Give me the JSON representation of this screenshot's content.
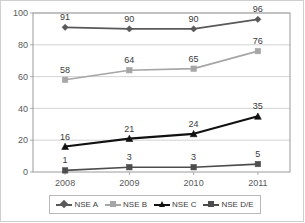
{
  "chart_data": {
    "type": "line",
    "title": "",
    "subtitle": "",
    "xlabel": "",
    "ylabel": "",
    "categories": [
      "2008",
      "2009",
      "2010",
      "2011"
    ],
    "ylim": [
      0,
      100
    ],
    "yticks": [
      0,
      20,
      40,
      60,
      80,
      100
    ],
    "grid": true,
    "grid_axis": "y",
    "legend_position": "bottom",
    "data_labels": true,
    "series": [
      {
        "name": "NSE A",
        "values": [
          91,
          90,
          90,
          96
        ],
        "labels": [
          "91",
          "90",
          "90",
          "96"
        ],
        "color": "#595959",
        "marker": "diamond"
      },
      {
        "name": "NSE B",
        "values": [
          58,
          64,
          65,
          76
        ],
        "labels": [
          "58",
          "64",
          "65",
          "76"
        ],
        "color": "#a6a6a6",
        "marker": "square"
      },
      {
        "name": "NSE C",
        "values": [
          16,
          21,
          24,
          35
        ],
        "labels": [
          "16",
          "21",
          "24",
          "35"
        ],
        "color": "#111111",
        "marker": "triangle"
      },
      {
        "name": "NSE D/E",
        "values": [
          1,
          3,
          3,
          5
        ],
        "labels": [
          "1",
          "3",
          "3",
          "5"
        ],
        "color": "#4d4d4d",
        "marker": "square"
      }
    ]
  },
  "axis": {
    "y_tick_labels": [
      "100",
      "80",
      "60",
      "40",
      "20",
      "0"
    ],
    "x_tick_labels": [
      "2008",
      "2009",
      "2010",
      "2011"
    ]
  },
  "legend": {
    "items": [
      {
        "label": "NSE A",
        "color": "#595959",
        "marker": "diamond"
      },
      {
        "label": "NSE B",
        "color": "#a6a6a6",
        "marker": "square"
      },
      {
        "label": "NSE C",
        "color": "#111111",
        "marker": "triangle"
      },
      {
        "label": "NSE D/E",
        "color": "#4d4d4d",
        "marker": "square"
      }
    ]
  },
  "colors": {
    "plot_border": "#9a9a9a",
    "grid": "#c8c8c8",
    "figure_frame": "#cfcfcf",
    "tick_text": "#58595b",
    "label_text": "#3a3a3a"
  }
}
